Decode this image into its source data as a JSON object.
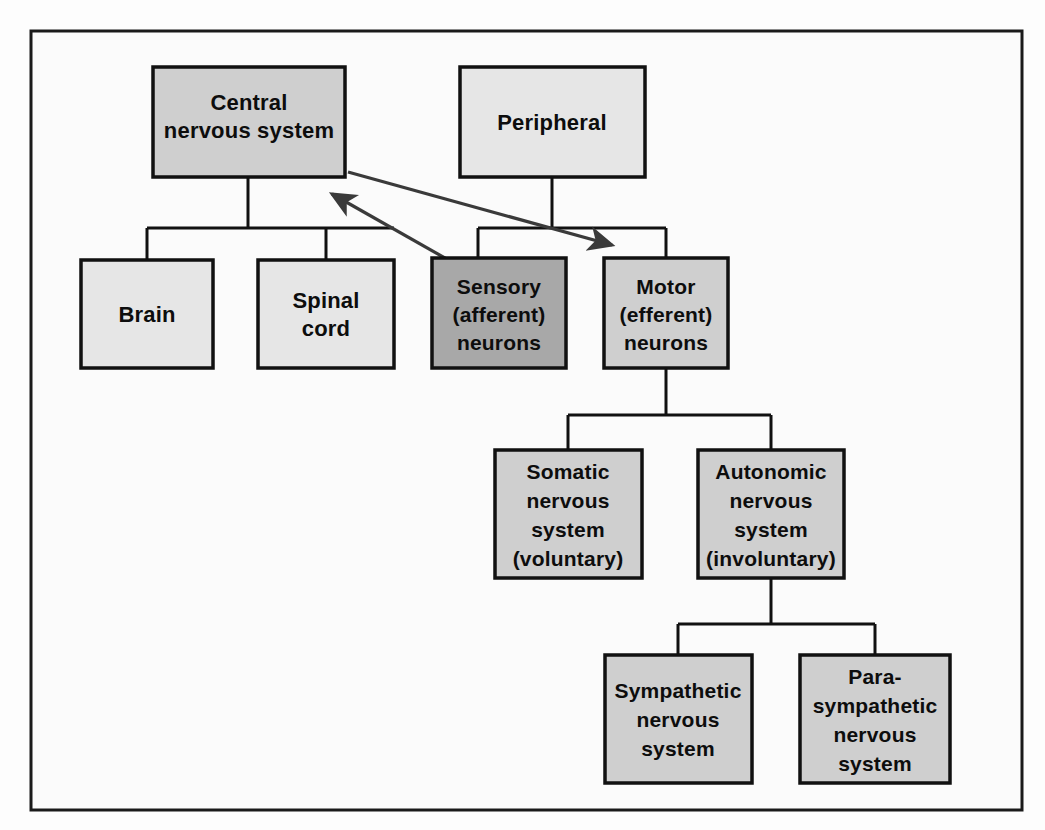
{
  "diagram": {
    "type": "hierarchy-tree",
    "frame": {
      "stroke_color": "#1a1a1a",
      "background": "#fbfbfb"
    },
    "palette": {
      "light_gray": "#e6e6e6",
      "mid_gray": "#cfcfcf",
      "dark_gray": "#a8a8a8",
      "border": "#111111",
      "arrow": "#3a3a3a"
    },
    "nodes": [
      {
        "id": "central",
        "lines": [
          "Central",
          "nervous system"
        ],
        "line1": "Central",
        "line2": "nervous system",
        "shade": "mid"
      },
      {
        "id": "peripheral",
        "lines": [
          "Peripheral"
        ],
        "line1": "Peripheral",
        "shade": "light"
      },
      {
        "id": "brain",
        "lines": [
          "Brain"
        ],
        "line1": "Brain",
        "shade": "light"
      },
      {
        "id": "spinal-cord",
        "lines": [
          "Spinal",
          "cord"
        ],
        "line1": "Spinal",
        "line2": "cord",
        "shade": "light"
      },
      {
        "id": "sensory",
        "lines": [
          "Sensory",
          "(afferent)",
          "neurons"
        ],
        "line1": "Sensory",
        "line2": "(afferent)",
        "line3": "neurons",
        "shade": "dark"
      },
      {
        "id": "motor",
        "lines": [
          "Motor",
          "(efferent)",
          "neurons"
        ],
        "line1": "Motor",
        "line2": "(efferent)",
        "line3": "neurons",
        "shade": "mid"
      },
      {
        "id": "somatic",
        "lines": [
          "Somatic",
          "nervous",
          "system",
          "(voluntary)"
        ],
        "line1": "Somatic",
        "line2": "nervous",
        "line3": "system",
        "line4": "(voluntary)",
        "shade": "mid"
      },
      {
        "id": "autonomic",
        "lines": [
          "Autonomic",
          "nervous",
          "system",
          "(involuntary)"
        ],
        "line1": "Autonomic",
        "line2": "nervous",
        "line3": "system",
        "line4": "(involuntary)",
        "shade": "mid"
      },
      {
        "id": "sympathetic",
        "lines": [
          "Sympathetic",
          "nervous",
          "system"
        ],
        "line1": "Sympathetic",
        "line2": "nervous",
        "line3": "system",
        "shade": "mid"
      },
      {
        "id": "parasympathetic",
        "lines": [
          "Para-",
          "sympathetic",
          "nervous",
          "system"
        ],
        "line1": "Para-",
        "line2": "sympathetic",
        "line3": "nervous",
        "line4": "system",
        "shade": "mid"
      }
    ],
    "connections": [
      {
        "from": "central",
        "to": "brain",
        "style": "elbow"
      },
      {
        "from": "central",
        "to": "spinal-cord",
        "style": "elbow"
      },
      {
        "from": "peripheral",
        "to": "sensory",
        "style": "elbow"
      },
      {
        "from": "peripheral",
        "to": "motor",
        "style": "elbow"
      },
      {
        "from": "motor",
        "to": "somatic",
        "style": "elbow"
      },
      {
        "from": "motor",
        "to": "autonomic",
        "style": "elbow"
      },
      {
        "from": "autonomic",
        "to": "sympathetic",
        "style": "elbow"
      },
      {
        "from": "autonomic",
        "to": "parasympathetic",
        "style": "elbow"
      },
      {
        "from": "sensory",
        "to": "central",
        "style": "arrow",
        "direction": "up-left"
      },
      {
        "from": "central",
        "to": "motor",
        "style": "arrow",
        "direction": "down-right"
      }
    ]
  }
}
